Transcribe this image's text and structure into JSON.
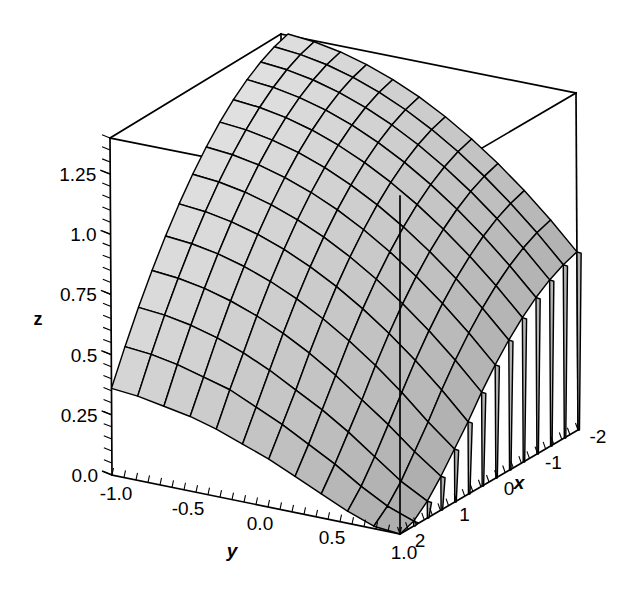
{
  "figure": {
    "type": "surface-3d",
    "background_color": "#ffffff",
    "line_color": "#000000",
    "surface_fill_light": "#e8e8e8",
    "surface_fill_dark": "#9a9a9a"
  },
  "axes": {
    "x": {
      "title": "x",
      "ticks": [
        "-2",
        "-1",
        "0",
        "1",
        "2"
      ],
      "tick_values": [
        -2,
        -1,
        0,
        1,
        2
      ],
      "range": [
        -2,
        2
      ],
      "direction": "front-left-to-back-right-descending"
    },
    "y": {
      "title": "y",
      "ticks": [
        "-1.0",
        "-0.5",
        "0.0",
        "0.5",
        "1.0"
      ],
      "tick_values": [
        -1,
        -0.5,
        0,
        0.5,
        1
      ],
      "range": [
        -1,
        1
      ]
    },
    "z": {
      "title": "z",
      "ticks": [
        "0.0",
        "0.25",
        "0.5",
        "0.75",
        "1.0",
        "1.25"
      ],
      "tick_values": [
        0,
        0.25,
        0.5,
        0.75,
        1.0,
        1.25
      ],
      "range": [
        0,
        1.4
      ]
    }
  },
  "chart_data": {
    "type": "surface",
    "title": "",
    "xlabel": "x",
    "ylabel": "y",
    "zlabel": "z",
    "xlim": [
      -2,
      2
    ],
    "ylim": [
      -1,
      1
    ],
    "zlim": [
      0,
      1.4
    ],
    "xticks": [
      -2,
      -1,
      0,
      1,
      2
    ],
    "yticks": [
      -1,
      -0.5,
      0,
      0.5,
      1
    ],
    "zticks": [
      0,
      0.25,
      0.5,
      0.75,
      1,
      1.25
    ],
    "grid": false,
    "legend": "none",
    "mesh_cols": 14,
    "mesh_rows": 12,
    "shading": "grayscale-lighting",
    "x": [
      -2,
      -1.6923,
      -1.3846,
      -1.0769,
      -0.7692,
      -0.4615,
      -0.1538,
      0.1538,
      0.4615,
      0.7692,
      1.0769,
      1.3846,
      1.6923,
      2
    ],
    "y": [
      -1,
      -0.8182,
      -0.6364,
      -0.4545,
      -0.2727,
      -0.0909,
      0.0909,
      0.2727,
      0.4545,
      0.6364,
      0.8182,
      1
    ],
    "z": [
      [
        1.4,
        1.39,
        1.37,
        1.34,
        1.3,
        1.25,
        1.19,
        1.12,
        1.04,
        0.95,
        0.85,
        0.74
      ],
      [
        1.38,
        1.37,
        1.35,
        1.32,
        1.28,
        1.23,
        1.17,
        1.1,
        1.02,
        0.93,
        0.83,
        0.72
      ],
      [
        1.35,
        1.34,
        1.32,
        1.29,
        1.25,
        1.2,
        1.14,
        1.07,
        0.99,
        0.9,
        0.8,
        0.69
      ],
      [
        1.31,
        1.3,
        1.28,
        1.25,
        1.21,
        1.16,
        1.1,
        1.03,
        0.95,
        0.86,
        0.76,
        0.65
      ],
      [
        1.26,
        1.25,
        1.23,
        1.2,
        1.16,
        1.11,
        1.05,
        0.98,
        0.9,
        0.81,
        0.71,
        0.6
      ],
      [
        1.2,
        1.19,
        1.17,
        1.14,
        1.1,
        1.05,
        0.99,
        0.92,
        0.84,
        0.75,
        0.65,
        0.54
      ],
      [
        1.13,
        1.12,
        1.1,
        1.07,
        1.03,
        0.98,
        0.92,
        0.85,
        0.77,
        0.68,
        0.58,
        0.47
      ],
      [
        1.05,
        1.04,
        1.02,
        0.99,
        0.95,
        0.9,
        0.84,
        0.77,
        0.69,
        0.6,
        0.5,
        0.39
      ],
      [
        0.96,
        0.95,
        0.93,
        0.9,
        0.86,
        0.81,
        0.75,
        0.68,
        0.6,
        0.51,
        0.41,
        0.3
      ],
      [
        0.86,
        0.85,
        0.83,
        0.8,
        0.76,
        0.71,
        0.65,
        0.58,
        0.5,
        0.41,
        0.31,
        0.22
      ],
      [
        0.75,
        0.74,
        0.72,
        0.69,
        0.65,
        0.6,
        0.54,
        0.47,
        0.39,
        0.31,
        0.22,
        0.14
      ],
      [
        0.63,
        0.62,
        0.6,
        0.57,
        0.53,
        0.48,
        0.42,
        0.36,
        0.29,
        0.21,
        0.13,
        0.07
      ],
      [
        0.5,
        0.49,
        0.47,
        0.44,
        0.41,
        0.36,
        0.31,
        0.25,
        0.19,
        0.12,
        0.06,
        0.02
      ],
      [
        0.36,
        0.35,
        0.33,
        0.31,
        0.28,
        0.24,
        0.2,
        0.15,
        0.1,
        0.05,
        0.01,
        0.0
      ]
    ]
  },
  "projection": {
    "box_top_left": [
      110,
      138
    ],
    "box_top_back": [
      281,
      34
    ],
    "box_top_right": [
      576,
      93
    ],
    "box_top_front": [
      400,
      196
    ],
    "box_bottom_left": [
      112,
      475
    ],
    "box_bottom_front": [
      400,
      534
    ],
    "box_bottom_right": [
      578,
      430
    ]
  }
}
